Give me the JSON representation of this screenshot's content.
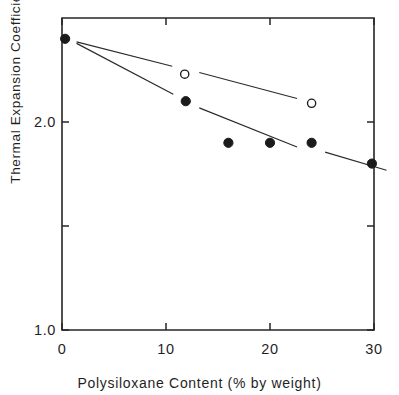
{
  "chart_data": {
    "type": "scatter",
    "title": "",
    "xlabel": "Polysiloxane Content (% by weight)",
    "ylabel_prefix": "Thermal Expansion Coefficient  (×10",
    "ylabel_exponent": "-5",
    "ylabel_suffix": "/°C )",
    "ylabel_plain": "Thermal Expansion Coefficient (×10-5/°C)",
    "xlim": [
      0,
      30
    ],
    "ylim": [
      1.0,
      2.5
    ],
    "xticks": [
      0,
      10,
      20,
      30
    ],
    "xtick_labels": [
      "0",
      "10",
      "20",
      "30"
    ],
    "yticks": [
      1.0,
      1.5,
      2.0
    ],
    "ytick_labels": [
      "1.0",
      "",
      "2.0"
    ],
    "ytick_labels_visible": [
      "1.0",
      "2.0"
    ],
    "grid": false,
    "legend": "none",
    "series": [
      {
        "name": "open-circle-series",
        "marker": "open-circle",
        "color": "#1b1b1b",
        "points": [
          {
            "x": 0.3,
            "y": 2.4
          },
          {
            "x": 11.8,
            "y": 2.23
          },
          {
            "x": 24.0,
            "y": 2.09
          }
        ],
        "line_segments": [
          {
            "x1": 1.4,
            "y1": 2.385,
            "x2": 10.6,
            "y2": 2.268
          },
          {
            "x1": 13.2,
            "y1": 2.238,
            "x2": 22.6,
            "y2": 2.113
          }
        ]
      },
      {
        "name": "filled-circle-series",
        "marker": "filled-circle",
        "color": "#1b1b1b",
        "points": [
          {
            "x": 0.3,
            "y": 2.4
          },
          {
            "x": 11.9,
            "y": 2.1
          },
          {
            "x": 16.0,
            "y": 1.9
          },
          {
            "x": 20.0,
            "y": 1.9
          },
          {
            "x": 24.0,
            "y": 1.9
          },
          {
            "x": 29.8,
            "y": 1.8
          }
        ],
        "line_segments": [
          {
            "x1": 1.4,
            "y1": 2.378,
            "x2": 10.7,
            "y2": 2.133
          },
          {
            "x1": 13.2,
            "y1": 2.068,
            "x2": 22.6,
            "y2": 1.88
          },
          {
            "x1": 25.3,
            "y1": 1.855,
            "x2": 31.2,
            "y2": 1.768
          }
        ]
      }
    ]
  },
  "axes": {
    "frame_color": "#262626",
    "background": "#ffffff"
  }
}
